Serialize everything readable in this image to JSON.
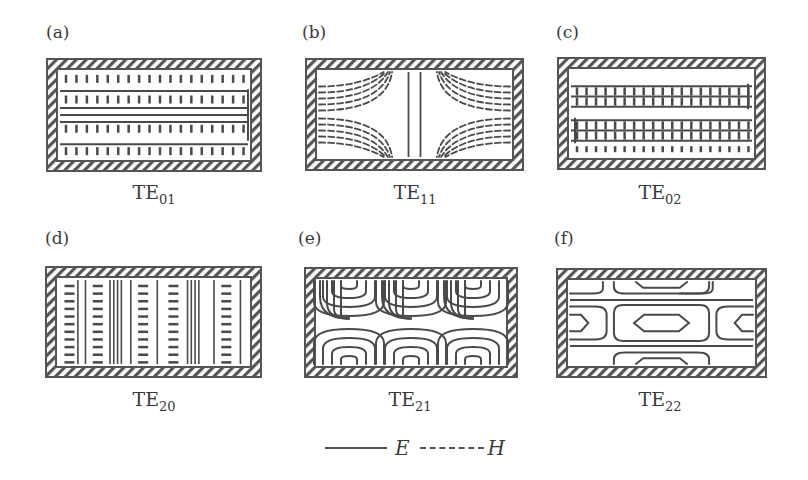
{
  "figure": {
    "panels": [
      {
        "id": "a",
        "label": "(a)",
        "mode": "TE",
        "sub": "01",
        "pattern": "te01",
        "box": {
          "x": 46,
          "y": 58,
          "w": 216,
          "h": 114
        },
        "label_pos": {
          "x": 46,
          "y": 22
        },
        "mode_pos": {
          "x": 94,
          "y": 181
        }
      },
      {
        "id": "b",
        "label": "(b)",
        "mode": "TE",
        "sub": "11",
        "pattern": "te11",
        "box": {
          "x": 305,
          "y": 58,
          "w": 219,
          "h": 113
        },
        "label_pos": {
          "x": 302,
          "y": 22
        },
        "mode_pos": {
          "x": 355,
          "y": 181
        }
      },
      {
        "id": "c",
        "label": "(c)",
        "mode": "TE",
        "sub": "02",
        "pattern": "te02",
        "box": {
          "x": 557,
          "y": 57,
          "w": 209,
          "h": 113
        },
        "label_pos": {
          "x": 556,
          "y": 22
        },
        "mode_pos": {
          "x": 600,
          "y": 181
        }
      },
      {
        "id": "d",
        "label": "(d)",
        "mode": "TE",
        "sub": "20",
        "pattern": "te20",
        "box": {
          "x": 45,
          "y": 266,
          "w": 217,
          "h": 112
        },
        "label_pos": {
          "x": 45,
          "y": 228
        },
        "mode_pos": {
          "x": 94,
          "y": 388
        }
      },
      {
        "id": "e",
        "label": "(e)",
        "mode": "TE",
        "sub": "21",
        "pattern": "te21",
        "box": {
          "x": 304,
          "y": 267,
          "w": 214,
          "h": 111
        },
        "label_pos": {
          "x": 298,
          "y": 228
        },
        "mode_pos": {
          "x": 350,
          "y": 388
        }
      },
      {
        "id": "f",
        "label": "(f)",
        "mode": "TE",
        "sub": "22",
        "pattern": "te22",
        "box": {
          "x": 556,
          "y": 268,
          "w": 211,
          "h": 110
        },
        "label_pos": {
          "x": 554,
          "y": 228
        },
        "mode_pos": {
          "x": 600,
          "y": 388
        }
      }
    ],
    "legend": {
      "e_symbol": "E",
      "h_symbol": "H",
      "e_style": "solid",
      "h_style": "dashed"
    },
    "colors": {
      "line": "#4a4a4a",
      "wall_border": "#555555",
      "hatch": "#555555",
      "background": "#ffffff"
    },
    "wall_thickness": 11
  }
}
